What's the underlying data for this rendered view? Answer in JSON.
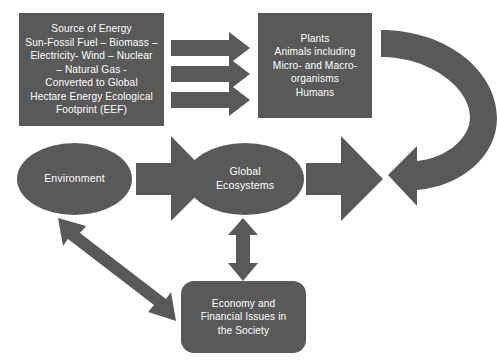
{
  "diagram": {
    "background_color": "#ffffff",
    "shape_fill_color": "#595959",
    "shape_text_color": "#ffffff",
    "nodes": {
      "energy": {
        "shape": "rectangle",
        "text": "Source of Energy\nSun-Fossil Fuel – Biomass –\nElectricity- Wind – Nuclear\n– Natural Gas -\nConverted to Global\nHectare  Energy Ecological\nFootprint (EEF)"
      },
      "biota": {
        "shape": "rectangle",
        "text": "Plants\nAnimals including\nMicro- and Macro-\norganisms\nHumans"
      },
      "global_ecosystems": {
        "shape": "ellipse",
        "text": "Global\nEcosystems"
      },
      "environment": {
        "shape": "ellipse",
        "text": "Environment"
      },
      "economy": {
        "shape": "rounded-rectangle",
        "text": "Economy and\nFinancial Issues in\nthe Society"
      }
    },
    "connectors": [
      {
        "name": "energy-to-biota-arrow-1",
        "type": "straight-arrow",
        "direction": "right",
        "from": "energy",
        "to": "biota"
      },
      {
        "name": "energy-to-biota-arrow-2",
        "type": "straight-arrow",
        "direction": "right",
        "from": "energy",
        "to": "biota"
      },
      {
        "name": "energy-to-biota-arrow-3",
        "type": "straight-arrow",
        "direction": "right",
        "from": "energy",
        "to": "biota"
      },
      {
        "name": "biota-return-curved-arrow",
        "type": "curved-u-turn-arrow",
        "direction": "clockwise-left",
        "from": "biota",
        "to": "global-ecosystems"
      },
      {
        "name": "curved-to-ecosystems-arrow",
        "type": "straight-arrow",
        "direction": "left",
        "from": "biota",
        "to": "global-ecosystems"
      },
      {
        "name": "ecosystems-to-environment-arrow",
        "type": "straight-arrow",
        "direction": "left",
        "from": "global-ecosystems",
        "to": "environment"
      },
      {
        "name": "ecosystems-economy-double-arrow",
        "type": "double-headed-arrow",
        "direction": "vertical",
        "from": "global-ecosystems",
        "to": "economy"
      },
      {
        "name": "environment-economy-double-arrow",
        "type": "double-headed-arrow",
        "direction": "diagonal",
        "from": "environment",
        "to": "economy"
      }
    ]
  }
}
